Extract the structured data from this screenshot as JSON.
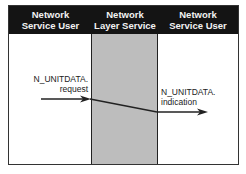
{
  "diagram": {
    "columns": [
      {
        "title_line1": "Network",
        "title_line2": "Service User"
      },
      {
        "title_line1": "Network",
        "title_line2": "Layer Service"
      },
      {
        "title_line1": "Network",
        "title_line2": "Service User"
      }
    ],
    "left_label": {
      "line1": "N_UNITDATA.",
      "line2": "request"
    },
    "right_label": {
      "line1": "N_UNITDATA.",
      "line2": "indication"
    },
    "colors": {
      "header_bg": "#141414",
      "header_text": "#f2f2f2",
      "middle_column": "#bdbdbd",
      "border": "#333333"
    }
  }
}
